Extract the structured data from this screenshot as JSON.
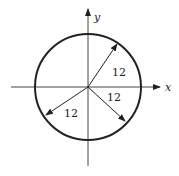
{
  "diagram": {
    "title": "",
    "axes": {
      "x_label": "x",
      "y_label": "y"
    },
    "circle": {
      "center": [
        0,
        0
      ],
      "radius_value": "12"
    },
    "radius_labels": [
      {
        "id": "upper-right",
        "text": "12"
      },
      {
        "id": "lower-right",
        "text": "12"
      },
      {
        "id": "lower-left",
        "text": "12"
      }
    ],
    "colors": {
      "stroke": "#222222",
      "axis": "#444444",
      "background": "#ffffff"
    }
  }
}
